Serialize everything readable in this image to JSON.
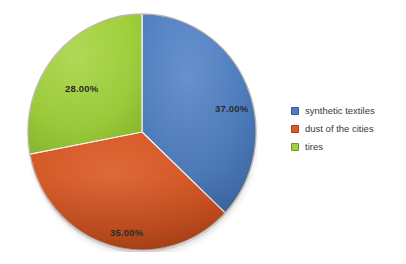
{
  "chart_data": {
    "type": "pie",
    "title": "",
    "subtitle": "",
    "xlabel": "",
    "ylabel": "",
    "grid": false,
    "legend_position": "right",
    "start_angle_deg": 0,
    "direction": "clockwise",
    "categories": [
      "synthetic textiles",
      "dust of the cities",
      "tires"
    ],
    "values": [
      37.0,
      35.0,
      28.0
    ],
    "value_unit": "percent",
    "data_labels": [
      "37.00%",
      "35.00%",
      "28.00%"
    ],
    "colors": [
      "#4f7fc0",
      "#e05a25",
      "#a0d03c"
    ],
    "slices": [
      {
        "label": "synthetic textiles",
        "value": 37.0,
        "data_label": "37.00%",
        "color": "#4f7fc0"
      },
      {
        "label": "dust of the cities",
        "value": 35.0,
        "data_label": "35.00%",
        "color": "#e05a25"
      },
      {
        "label": "tires",
        "value": 28.0,
        "data_label": "28.00%",
        "color": "#a0d03c"
      }
    ],
    "annotations": []
  },
  "legend": {
    "items": [
      {
        "label": "synthetic textiles",
        "color": "#4f7fc0"
      },
      {
        "label": "dust of the cities",
        "color": "#e05a25"
      },
      {
        "label": "tires",
        "color": "#a0d03c"
      }
    ]
  },
  "labels": {
    "synthetic": "37.00%",
    "dust": "35.00%",
    "tires": "28.00%"
  },
  "colors": {
    "synthetic_textiles": "#4f7fc0",
    "dust_of_the_cities": "#e05a25",
    "tires": "#a0d03c",
    "background": "#ffffff",
    "label_text": "#2a2a2a",
    "legend_text": "#3a3a3a"
  }
}
